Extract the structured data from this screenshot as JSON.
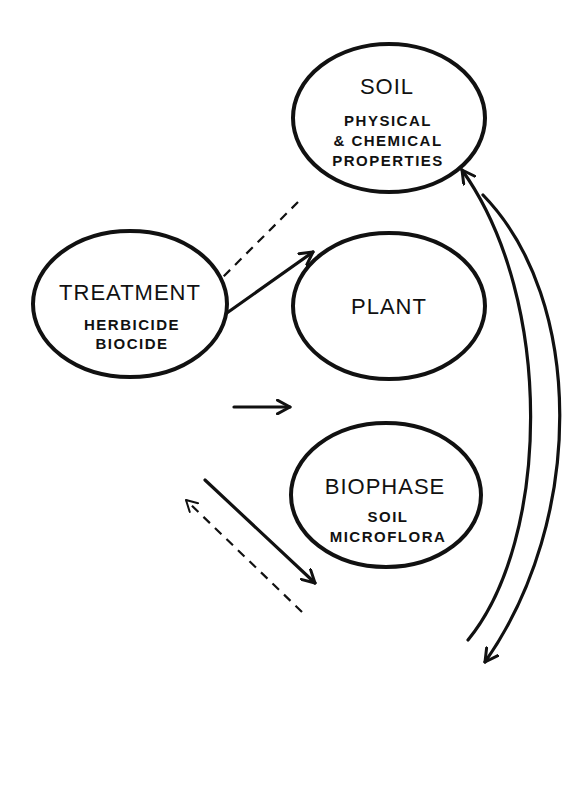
{
  "diagram": {
    "nodes": {
      "soil": {
        "title": "SOIL",
        "subtitle_lines": [
          "PHYSICAL",
          "& CHEMICAL",
          "PROPERTIES"
        ]
      },
      "treatment": {
        "title": "TREATMENT",
        "subtitle_lines": [
          "HERBICIDE",
          "BIOCIDE"
        ]
      },
      "plant": {
        "title": "PLANT",
        "subtitle_lines": []
      },
      "biophase": {
        "title": "BIOPHASE",
        "subtitle_lines": [
          "SOIL",
          "MICROFLORA"
        ]
      }
    },
    "edges": [
      {
        "from": "TREATMENT",
        "to": "SOIL",
        "style": "solid"
      },
      {
        "from": "SOIL",
        "to": "TREATMENT",
        "style": "dashed"
      },
      {
        "from": "TREATMENT",
        "to": "PLANT",
        "style": "solid"
      },
      {
        "from": "TREATMENT",
        "to": "BIOPHASE",
        "style": "solid"
      },
      {
        "from": "BIOPHASE",
        "to": "TREATMENT",
        "style": "dashed"
      },
      {
        "from": "PLANT",
        "to": "SOIL",
        "style": "solid"
      },
      {
        "from": "SOIL",
        "to": "PLANT",
        "style": "solid"
      },
      {
        "from": "PLANT",
        "to": "BIOPHASE",
        "style": "solid"
      },
      {
        "from": "BIOPHASE",
        "to": "PLANT",
        "style": "solid"
      },
      {
        "from": "SOIL",
        "to": "BIOPHASE",
        "style": "solid-curved"
      },
      {
        "from": "BIOPHASE",
        "to": "SOIL",
        "style": "solid-curved"
      }
    ],
    "colors": {
      "stroke": "#111111",
      "background": "#ffffff"
    }
  }
}
